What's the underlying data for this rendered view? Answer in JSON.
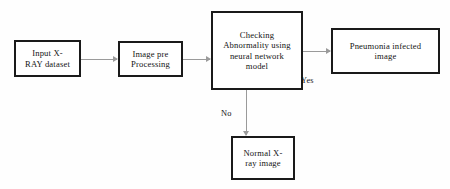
{
  "diagram": {
    "background_color": "#fefefe",
    "node_border_color": "#1a1a1a",
    "connector_color": "#9a9a9a",
    "text_color": "#141414",
    "nodes": [
      {
        "id": "input",
        "label": "Input X-\nRAY dataset"
      },
      {
        "id": "preprocess",
        "label": "Image pre\nProcessing"
      },
      {
        "id": "checking",
        "label": "Checking\nAbnormality using\nneural network\nmodel"
      },
      {
        "id": "pneumonia",
        "label": "Pneumonia infected\nimage"
      },
      {
        "id": "normal",
        "label": "Normal X-\nray image"
      }
    ],
    "edge_labels": {
      "yes": "Yes",
      "no": "No"
    }
  }
}
